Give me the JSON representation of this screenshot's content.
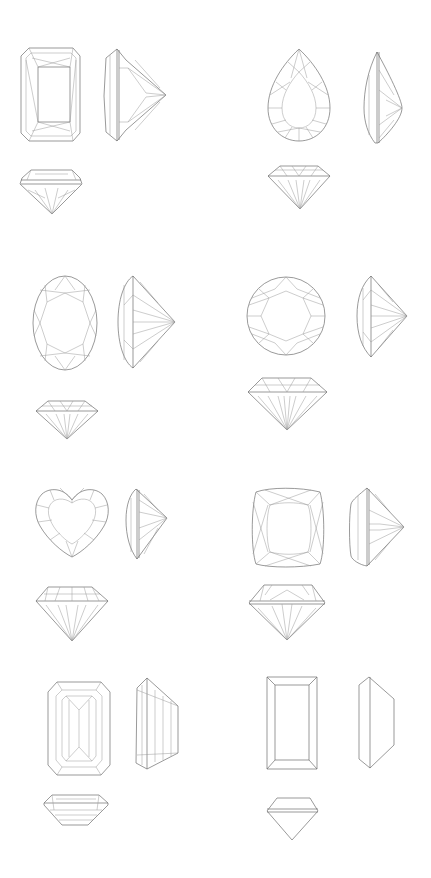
{
  "background": "#ffffff",
  "line_color": "#6e6e6e",
  "gems": [
    {
      "cut": "radiant",
      "views": [
        "top",
        "side",
        "front"
      ]
    },
    {
      "cut": "pear",
      "views": [
        "top",
        "side",
        "front"
      ]
    },
    {
      "cut": "oval",
      "views": [
        "top",
        "side",
        "front"
      ]
    },
    {
      "cut": "round-brilliant",
      "views": [
        "top",
        "side",
        "front"
      ]
    },
    {
      "cut": "heart",
      "views": [
        "top",
        "side",
        "front"
      ]
    },
    {
      "cut": "cushion",
      "views": [
        "top",
        "side",
        "front"
      ]
    },
    {
      "cut": "emerald",
      "views": [
        "top",
        "side",
        "front"
      ]
    },
    {
      "cut": "baguette",
      "views": [
        "top",
        "side",
        "front"
      ]
    }
  ]
}
